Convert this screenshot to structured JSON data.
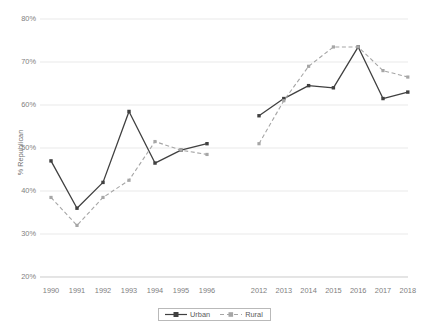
{
  "chart_data": {
    "type": "line",
    "title": "",
    "subtitle": "",
    "xlabel": "",
    "ylabel": "% Republican",
    "ylim": [
      20,
      80
    ],
    "yticks": [
      80,
      70,
      60,
      50,
      40,
      30,
      20
    ],
    "ytick_labels": [
      "80%",
      "70%",
      "60%",
      "50%",
      "40%",
      "30%",
      "20%"
    ],
    "grid": true,
    "grid_axis": "y",
    "legend_position": "bottom-center",
    "x": [
      1990,
      1991,
      1992,
      1993,
      1994,
      1995,
      1996,
      2012,
      2013,
      2014,
      2015,
      2016,
      2017,
      2018
    ],
    "xtick_labels": [
      "1990",
      "1991",
      "1992",
      "1993",
      "1994",
      "1995",
      "1996",
      "2012",
      "2013",
      "2014",
      "2015",
      "2016",
      "2017",
      "2018"
    ],
    "x_gap_after": 1996,
    "series": [
      {
        "name": "Urban",
        "color": "#404040",
        "line_style": "solid",
        "marker": "square",
        "values": [
          47,
          36,
          42,
          58.5,
          46.5,
          49.5,
          51,
          57.5,
          61.5,
          64.5,
          64,
          73.5,
          61.5,
          63
        ]
      },
      {
        "name": "Rural",
        "color": "#a6a6a6",
        "line_style": "dashed",
        "marker": "square",
        "values": [
          38.5,
          32,
          38.5,
          42.5,
          51.5,
          49.5,
          48.5,
          51,
          61,
          69,
          73.5,
          73.5,
          68,
          66.5
        ]
      }
    ]
  },
  "legend": {
    "items": [
      {
        "label": "Urban"
      },
      {
        "label": "Rural"
      }
    ]
  }
}
